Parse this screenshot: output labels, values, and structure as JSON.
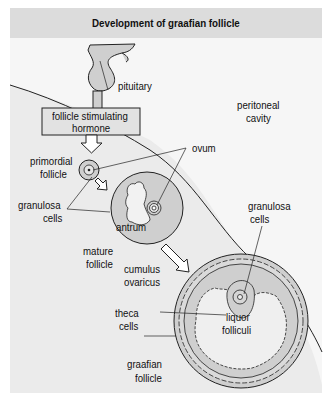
{
  "title": "Development of graafian follicle",
  "labels": {
    "pituitary": "pituitary",
    "fsh_line1": "follicle  stimulating",
    "fsh_line2": "hormone",
    "peritoneal_line1": "peritoneal",
    "peritoneal_line2": "cavity",
    "ovum": "ovum",
    "primordial_line1": "primordial",
    "primordial_line2": "follicle",
    "granulosa_left_line1": "granulosa",
    "granulosa_left_line2": "cells",
    "antrum": "antrum",
    "mature_line1": "mature",
    "mature_line2": "follicle",
    "granulosa_right_line1": "granulosa",
    "granulosa_right_line2": "cells",
    "cumulus_line1": "cumulus",
    "cumulus_line2": "ovaricus",
    "theca_line1": "theca",
    "theca_line2": "cells",
    "liquor_line1": "liquor",
    "liquor_line2": "folliculi",
    "graafian_line1": "graafian",
    "graafian_line2": "follicle"
  },
  "colors": {
    "ovary_fill": "#ebebeb",
    "cavity_fill": "#f7f7f7",
    "title_bg": "#dcdcdc",
    "structure_fill": "#cfcfcf",
    "line": "#222222"
  }
}
